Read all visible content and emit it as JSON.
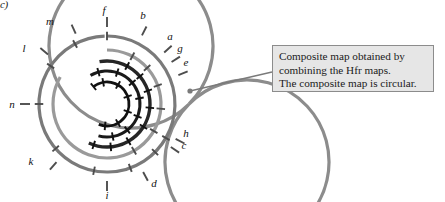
{
  "figure": {
    "panel_label": "c)",
    "callout": {
      "lines": [
        "Composite map obtained by",
        "combining the Hfr maps.",
        "The composite map is circular."
      ]
    },
    "colors": {
      "outer_ring": "#8c8c8c",
      "ring_2": "#7a7a7a",
      "ring_3": "#9a9a9a",
      "ring_4": "#262626",
      "ring_5": "#a8a8a8",
      "ring_6": "#1a1a1a",
      "ring_7": "#111111",
      "tick_dark": "#111111",
      "tick_gray": "#4d4d4d",
      "callout_bg": "#e6e6e6",
      "callout_border": "#8c8c8c",
      "leader_line": "#7a7a7a",
      "background": "#ffffff"
    },
    "gene_labels": [
      {
        "name": "f",
        "x": 104,
        "y": 11,
        "angle_deg": 90
      },
      {
        "name": "b",
        "x": 143,
        "y": 16,
        "angle_deg": 63
      },
      {
        "name": "a",
        "x": 170,
        "y": 37,
        "angle_deg": 42
      },
      {
        "name": "g",
        "x": 180,
        "y": 49,
        "angle_deg": 33
      },
      {
        "name": "e",
        "x": 186,
        "y": 63,
        "angle_deg": 22
      },
      {
        "name": "h",
        "x": 186,
        "y": 134,
        "angle_deg": -27
      },
      {
        "name": "c",
        "x": 184,
        "y": 146,
        "angle_deg": -34
      },
      {
        "name": "d",
        "x": 154,
        "y": 184,
        "angle_deg": -62
      },
      {
        "name": "i",
        "x": 107,
        "y": 196,
        "angle_deg": -90
      },
      {
        "name": "k",
        "x": 31,
        "y": 162,
        "angle_deg": -131
      },
      {
        "name": "n",
        "x": 12,
        "y": 105,
        "angle_deg": 180
      },
      {
        "name": "l",
        "x": 24,
        "y": 49,
        "angle_deg": 140
      },
      {
        "name": "m",
        "x": 50,
        "y": 22,
        "angle_deg": 114
      }
    ],
    "rings": [
      {
        "id": "ring-outer",
        "radius": 82,
        "start_deg": 0,
        "end_deg": 360,
        "color_key": "outer_ring",
        "width": 3.2,
        "ticks_deg": [
          90,
          63,
          42,
          33,
          22,
          -27,
          -34,
          -62,
          -90,
          -131,
          180,
          140,
          114
        ]
      },
      {
        "id": "ring-2",
        "radius": 68,
        "start_deg": 90,
        "end_deg": -268,
        "color_key": "ring_2",
        "width": 3.2,
        "ticks_deg": [
          90,
          118,
          146,
          180,
          -139,
          -101,
          -70,
          -45,
          -30
        ]
      },
      {
        "id": "ring-3",
        "radius": 54,
        "start_deg": 90,
        "end_deg": -210,
        "color_key": "ring_3",
        "width": 3.2,
        "ticks_deg": [
          62,
          42,
          20,
          -5,
          -30,
          -60
        ]
      },
      {
        "id": "ring-4",
        "radius": 43,
        "start_deg": 100,
        "end_deg": -115,
        "color_key": "ring_4",
        "width": 3.4,
        "ticks_deg": [
          62,
          40,
          18,
          -5,
          -32,
          -60,
          -85,
          -108
        ]
      },
      {
        "id": "ring-5",
        "radius": 33,
        "start_deg": 120,
        "end_deg": -105,
        "color_key": "ring_6",
        "width": 3.0,
        "ticks_deg": [
          105,
          72,
          40,
          10,
          -22,
          -52,
          -80
        ]
      },
      {
        "id": "ring-6",
        "radius": 22,
        "start_deg": 128,
        "end_deg": -112,
        "color_key": "ring_7",
        "width": 2.8,
        "ticks_deg": [
          128,
          100,
          60,
          20,
          -20,
          -60,
          -95
        ]
      }
    ],
    "leader": {
      "dot_x": 190,
      "dot_y": 91,
      "line_x1": 190,
      "line_y1": 91,
      "line_x2": 272,
      "line_y2": 72
    },
    "center": {
      "cx": 107,
      "cy": 104
    }
  }
}
